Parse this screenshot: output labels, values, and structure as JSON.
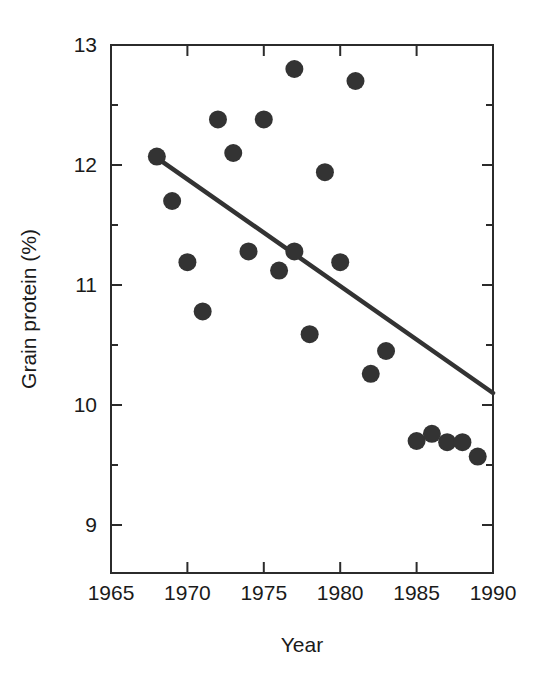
{
  "chart_data": {
    "type": "scatter",
    "title": "",
    "xlabel": "Year",
    "ylabel": "Grain protein (%)",
    "xlim": [
      1965,
      1990
    ],
    "ylim": [
      8.6,
      13.0
    ],
    "grid": false,
    "legend": "none",
    "x_ticks": [
      1965,
      1970,
      1975,
      1980,
      1985,
      1990
    ],
    "x_tick_labels": [
      "1965",
      "1970",
      "1975",
      "1980",
      "1985",
      "1990"
    ],
    "x_minor_ticks": [],
    "y_ticks": [
      9,
      10,
      11,
      12,
      13
    ],
    "y_tick_labels": [
      "9",
      "10",
      "11",
      "12",
      "13"
    ],
    "y_minor_ticks": [
      9.5,
      10.5,
      11.5,
      12.5
    ],
    "points": [
      {
        "x": 1968,
        "y": 12.07
      },
      {
        "x": 1969,
        "y": 11.7
      },
      {
        "x": 1970,
        "y": 11.19
      },
      {
        "x": 1971,
        "y": 10.78
      },
      {
        "x": 1972,
        "y": 12.38
      },
      {
        "x": 1973,
        "y": 12.1
      },
      {
        "x": 1974,
        "y": 11.28
      },
      {
        "x": 1975,
        "y": 12.38
      },
      {
        "x": 1976,
        "y": 11.12
      },
      {
        "x": 1977,
        "y": 12.8
      },
      {
        "x": 1977,
        "y": 11.28
      },
      {
        "x": 1978,
        "y": 10.59
      },
      {
        "x": 1979,
        "y": 11.94
      },
      {
        "x": 1980,
        "y": 11.19
      },
      {
        "x": 1981,
        "y": 12.7
      },
      {
        "x": 1982,
        "y": 10.26
      },
      {
        "x": 1983,
        "y": 10.45
      },
      {
        "x": 1985,
        "y": 9.7
      },
      {
        "x": 1986,
        "y": 9.76
      },
      {
        "x": 1987,
        "y": 9.69
      },
      {
        "x": 1988,
        "y": 9.69
      },
      {
        "x": 1989,
        "y": 9.57
      }
    ],
    "trend_line": {
      "name": "linear regression",
      "x_start": 1968,
      "y_start": 12.06,
      "x_end": 1990,
      "y_end": 10.1
    },
    "colors": {
      "point": "#333333",
      "line": "#333333",
      "axis": "#2b2b2b",
      "background": "#ffffff",
      "text": "#1a1a1a"
    }
  },
  "axes_geometry": {
    "plot_left": 111,
    "plot_right": 493,
    "plot_top": 45,
    "plot_bottom": 573,
    "point_radius": 9
  }
}
